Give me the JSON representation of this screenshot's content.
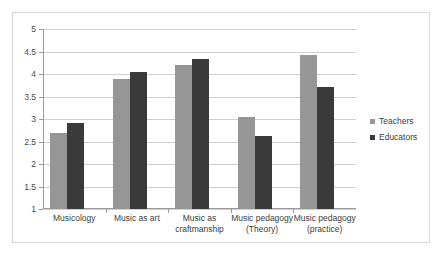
{
  "chart_data": {
    "type": "bar",
    "title": "",
    "subtitle": "",
    "xlabel": "",
    "ylabel": "",
    "ylim": [
      1,
      5
    ],
    "ytick_labels": [
      "5",
      "4.5",
      "4",
      "3.5",
      "3",
      "2.5",
      "2",
      "1.5",
      "1"
    ],
    "ytick_values": [
      5,
      4.5,
      4,
      3.5,
      3,
      2.5,
      2,
      1.5,
      1
    ],
    "grid": true,
    "legend_position": "right",
    "categories": [
      "Musicology",
      "Music as art",
      "Music as craftmanship",
      "Music pedagogy (Theory)",
      "Music pedagogy (practice)"
    ],
    "series": [
      {
        "name": "Teachers",
        "color": "#969696",
        "values": [
          2.69,
          3.88,
          4.21,
          3.04,
          4.43
        ]
      },
      {
        "name": "Educators",
        "color": "#3a3a3a",
        "values": [
          2.92,
          4.04,
          4.33,
          2.63,
          3.72
        ]
      }
    ]
  }
}
